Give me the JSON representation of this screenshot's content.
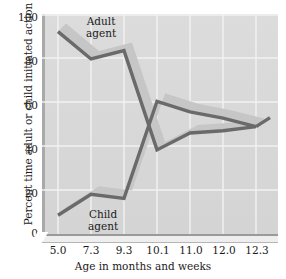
{
  "chart_data": {
    "type": "line",
    "title": "",
    "xlabel": "Age in months and weeks",
    "ylabel": "Percent time adult or child initiated action",
    "categories": [
      "5.0",
      "7.3",
      "9.3",
      "10.1",
      "11.0",
      "12.0",
      "12.3"
    ],
    "x_tick_labels": [
      "5.0",
      "7.3",
      "9.3",
      "10.1",
      "11.0",
      "12.0",
      "12.3"
    ],
    "y_tick_labels": [
      "0",
      "20",
      "40",
      "60",
      "80",
      "100"
    ],
    "y_tick_values": [
      0,
      20,
      40,
      60,
      80,
      100
    ],
    "ylim": [
      0,
      100
    ],
    "xlim": [
      0,
      6
    ],
    "grid": true,
    "grid_color": "#ffffff",
    "panel_color": "#d9d9d9",
    "line_color": "#6a6a6a",
    "band_color": "#c4c4c4",
    "legend_position": "inline-annotation",
    "series": [
      {
        "name": "Adult agent",
        "label": "Adult\nagent",
        "label_line1": "Adult",
        "label_line2": "agent",
        "values": [
          93,
          80,
          84,
          37,
          45,
          46,
          48
        ]
      },
      {
        "name": "Child agent",
        "label": "Child\nagent",
        "label_line1": "Child",
        "label_line2": "agent",
        "values": [
          6,
          16,
          14,
          60,
          55,
          52,
          48
        ]
      }
    ],
    "annotations": [
      {
        "text": "Adult agent",
        "series": "Adult agent"
      },
      {
        "text": "Child agent",
        "series": "Child agent"
      }
    ]
  }
}
